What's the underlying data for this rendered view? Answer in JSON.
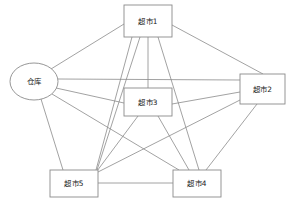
{
  "diagram": {
    "background_color": "#ffffff",
    "line_color": "#8a8a8a",
    "text_color": "#1a1a1a",
    "nodes": [
      {
        "id": "warehouse",
        "label": "仓库",
        "shape": "ellipse",
        "cx": 34,
        "cy": 81.5,
        "rx": 24,
        "ry": 18.5
      },
      {
        "id": "market1",
        "label": "超市1",
        "shape": "rect",
        "x": 124,
        "y": 5,
        "w": 48,
        "h": 32
      },
      {
        "id": "market2",
        "label": "超市2",
        "shape": "rect",
        "x": 240,
        "y": 74,
        "w": 45,
        "h": 30
      },
      {
        "id": "market3",
        "label": "超市3",
        "shape": "rect",
        "x": 124,
        "y": 88,
        "w": 48,
        "h": 28
      },
      {
        "id": "market4",
        "label": "超市4",
        "shape": "rect",
        "x": 173,
        "y": 170,
        "w": 48,
        "h": 27
      },
      {
        "id": "market5",
        "label": "超市5",
        "shape": "rect",
        "x": 50,
        "y": 170,
        "w": 48,
        "h": 27
      }
    ],
    "edges": [
      {
        "from": "warehouse",
        "to": "market1",
        "x1": 51,
        "y1": 69,
        "x2": 124,
        "y2": 24
      },
      {
        "from": "warehouse",
        "to": "market2",
        "x1": 58,
        "y1": 79,
        "x2": 240,
        "y2": 80
      },
      {
        "from": "warehouse",
        "to": "market3",
        "x1": 56,
        "y1": 88,
        "x2": 124,
        "y2": 103
      },
      {
        "from": "warehouse",
        "to": "market4",
        "x1": 52,
        "y1": 94,
        "x2": 179,
        "y2": 170
      },
      {
        "from": "warehouse",
        "to": "market5",
        "x1": 41,
        "y1": 99,
        "x2": 63,
        "y2": 170
      },
      {
        "from": "market1",
        "to": "market2",
        "x1": 172,
        "y1": 25,
        "x2": 263,
        "y2": 74
      },
      {
        "from": "market1",
        "to": "market3",
        "x1": 148,
        "y1": 37,
        "x2": 148,
        "y2": 88
      },
      {
        "from": "market1",
        "to": "market4",
        "x1": 158,
        "y1": 37,
        "x2": 199,
        "y2": 170
      },
      {
        "from": "market1",
        "to": "market5",
        "x1": 140,
        "y1": 37,
        "x2": 97,
        "y2": 170
      },
      {
        "from": "market1",
        "to": "market5",
        "x1": 132,
        "y1": 37,
        "x2": 96,
        "y2": 170
      },
      {
        "from": "market2",
        "to": "market3",
        "x1": 240,
        "y1": 92,
        "x2": 172,
        "y2": 104
      },
      {
        "from": "market2",
        "to": "market4",
        "x1": 257,
        "y1": 104,
        "x2": 206,
        "y2": 170
      },
      {
        "from": "market2",
        "to": "market5",
        "x1": 240,
        "y1": 100,
        "x2": 98,
        "y2": 172
      },
      {
        "from": "market3",
        "to": "market4",
        "x1": 158,
        "y1": 116,
        "x2": 189,
        "y2": 170
      },
      {
        "from": "market3",
        "to": "market5",
        "x1": 138,
        "y1": 116,
        "x2": 97,
        "y2": 171
      },
      {
        "from": "market4",
        "to": "market5",
        "x1": 173,
        "y1": 183,
        "x2": 98,
        "y2": 183
      }
    ]
  }
}
